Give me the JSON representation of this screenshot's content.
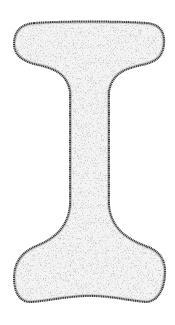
{
  "figure": {
    "alt": "Stippled line drawing of an I-shaped (dumbbell / bone-like) silhouette",
    "colors": {
      "background": "#ffffff",
      "outline": "#3a3a3a",
      "fill": "#f3f3f3",
      "stipple": "#8a8a8a"
    }
  }
}
